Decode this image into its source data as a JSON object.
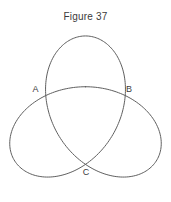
{
  "figure": {
    "title": "Figure 37",
    "type": "trefoil-curve-diagram",
    "points": [
      {
        "label": "A",
        "x": 35.5,
        "y": 91.5
      },
      {
        "label": "B",
        "x": 129,
        "y": 91.5
      },
      {
        "label": "C",
        "x": 86,
        "y": 174.5
      }
    ],
    "curve": {
      "stroke": "#5f5f5f",
      "stroke_width": 1,
      "cx": 85.5,
      "cy": 118.5,
      "scale": 25.4,
      "a": 1,
      "b": 2.25
    },
    "colors": {
      "background": "#ffffff",
      "text": "#3b3b3b"
    }
  }
}
